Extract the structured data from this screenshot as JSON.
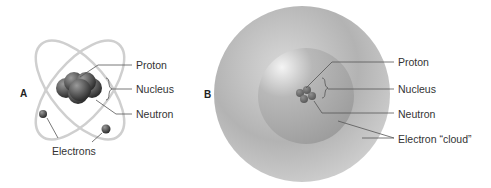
{
  "figure": {
    "panel_a": {
      "letter": "A",
      "title": "Bohr-style atom model",
      "labels": {
        "proton": "Proton",
        "nucleus": "Nucleus",
        "neutron": "Neutron",
        "electrons": "Electrons"
      }
    },
    "panel_b": {
      "letter": "B",
      "title": "Electron cloud atom model",
      "labels": {
        "proton": "Proton",
        "nucleus": "Nucleus",
        "neutron": "Neutron",
        "electron_cloud": "Electron “cloud”"
      }
    },
    "colors": {
      "orbit": "#c8c8c8",
      "nucleus_dark": "#3a3a3a",
      "cloud_outer": "#b0b0b0",
      "cloud_inner": "#a0a0a0",
      "leader_line": "#555555"
    }
  }
}
